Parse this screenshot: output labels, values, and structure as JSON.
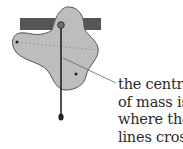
{
  "diagram": {
    "colors": {
      "bar": "#555555",
      "lamina_fill": "#bdbdbd",
      "lamina_stroke": "#555555",
      "plumb_line": "#222222",
      "dashed_line": "#9a9a9a",
      "leader_line": "#666666"
    },
    "elements": [
      "support-bar",
      "lamina",
      "pivot-pin",
      "plumb-line",
      "plumb-bob",
      "suspension-point-left",
      "suspension-point-right",
      "dashed-line",
      "leader-line"
    ]
  },
  "caption": {
    "lines": [
      "the centre",
      "of mass is",
      "where the",
      "lines cross"
    ]
  }
}
